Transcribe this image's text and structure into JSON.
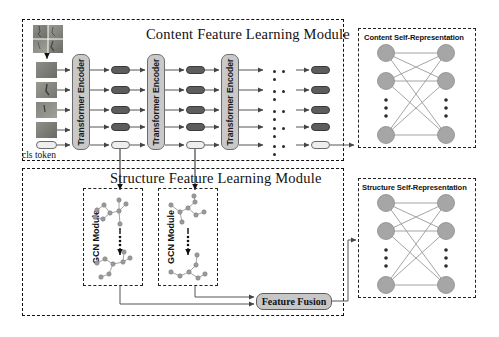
{
  "diagram": {
    "title_content_module": "Content Feature Learning Module",
    "title_structure_module": "Structure Feature Learning Module",
    "panel_content_selfrep": "Content Self-Representation",
    "panel_structure_selfrep": "Structure Self-Representation",
    "cls_token_label": "cls token",
    "encoder_label": "Transformer Encoder",
    "gcn_label": "GCN Module",
    "fusion_label": "Feature Fusion",
    "encoders": [
      {
        "label": "Transformer Encoder"
      },
      {
        "label": "Transformer Encoder"
      },
      {
        "label": "Transformer Encoder"
      }
    ],
    "gcn_modules": [
      {
        "label": "GCN Module"
      },
      {
        "label": "GCN Module"
      }
    ],
    "token_rows": 5,
    "token_columns": 4,
    "cls_row_index": 4,
    "image_patch_count": 4,
    "selfrep_nodes_per_side": 3,
    "colors": {
      "token_fill": "#5d5d5d",
      "cls_token_fill": "#eeeeee",
      "encoder_fill": "#c9c9c9",
      "fusion_fill": "#c7c7c7",
      "selfrep_node_fill": "#a6a6a6",
      "dashed_border": "#111111",
      "arrow_line": "#555555",
      "background": "#ffffff"
    }
  }
}
